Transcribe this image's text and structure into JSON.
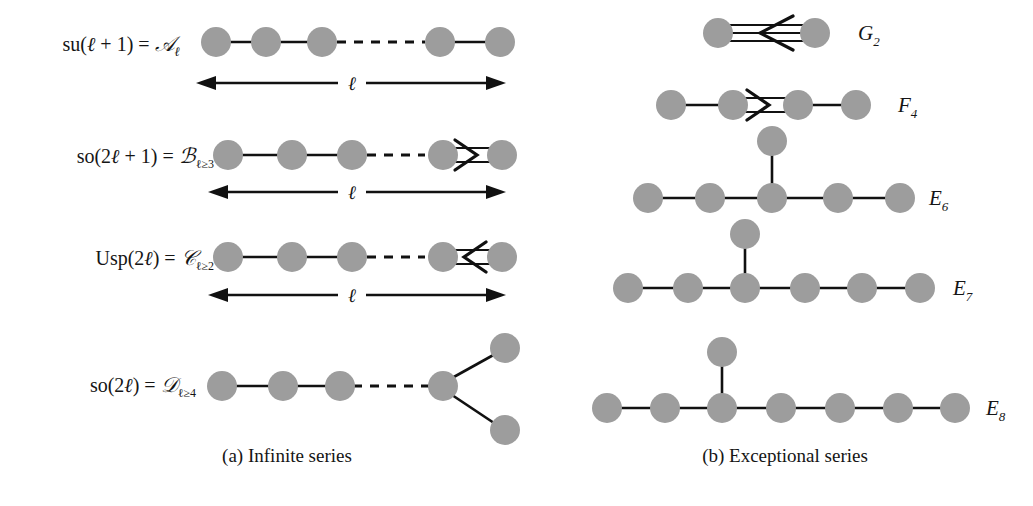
{
  "figure": {
    "background": "#ffffff",
    "node_color": "#9d9d9d",
    "line_color": "#111111",
    "panels": [
      {
        "id": "a",
        "caption": "(a) Infinite series"
      },
      {
        "id": "b",
        "caption": "(b) Exceptional series"
      }
    ]
  },
  "infinite_series": {
    "caption": "(a) Infinite series",
    "measure_symbol": "ℓ",
    "rows": [
      {
        "id": "A",
        "label_parts": {
          "lie": "su(",
          "arg": "ℓ + 1",
          "close": ") = ",
          "family": "𝒜",
          "subscript": "ℓ"
        },
        "label_plain": "su(ℓ + 1) = 𝒜ℓ",
        "nodes": 5,
        "dashed_gap": true,
        "bond": "single",
        "measure": "ℓ",
        "has_measure_arrow": true
      },
      {
        "id": "B",
        "label_parts": {
          "lie": "so(",
          "arg": "2ℓ + 1",
          "close": ") = ",
          "family": "ℬ",
          "subscript": "ℓ ≥ 3"
        },
        "label_plain": "so(2ℓ + 1) = ℬℓ≥3",
        "nodes": 5,
        "dashed_gap": true,
        "bond": "double-arrow-right",
        "measure": "ℓ",
        "has_measure_arrow": true
      },
      {
        "id": "C",
        "label_parts": {
          "lie": "Usp(",
          "arg": "2ℓ",
          "close": ") = ",
          "family": "𝒞",
          "subscript": "ℓ ≥ 2"
        },
        "label_plain": "Usp(2ℓ) = 𝒞ℓ≥2",
        "nodes": 5,
        "dashed_gap": true,
        "bond": "double-arrow-left",
        "measure": "ℓ",
        "has_measure_arrow": true
      },
      {
        "id": "D",
        "label_parts": {
          "lie": "so(",
          "arg": "2ℓ",
          "close": ") = ",
          "family": "𝒟",
          "subscript": "ℓ ≥ 4"
        },
        "label_plain": "so(2ℓ) = 𝒟ℓ≥4",
        "nodes": 4,
        "dashed_gap": true,
        "bond": "fork",
        "measure": "",
        "has_measure_arrow": false
      }
    ]
  },
  "exceptional_series": {
    "caption": "(b) Exceptional series",
    "rows": [
      {
        "id": "G2",
        "label_letter": "G",
        "label_sub": "2",
        "label_plain": "G₂",
        "chain_nodes": 2,
        "bond": "triple-arrow-left",
        "branch_at": null
      },
      {
        "id": "F4",
        "label_letter": "F",
        "label_sub": "4",
        "label_plain": "F₄",
        "chain_nodes": 4,
        "bond": "double-arrow-right",
        "bond_between": [
          2,
          3
        ],
        "branch_at": null
      },
      {
        "id": "E6",
        "label_letter": "E",
        "label_sub": "6",
        "label_plain": "E₆",
        "chain_nodes": 5,
        "bond": "single",
        "branch_at": 3
      },
      {
        "id": "E7",
        "label_letter": "E",
        "label_sub": "7",
        "label_plain": "E₇",
        "chain_nodes": 6,
        "bond": "single",
        "branch_at": 3
      },
      {
        "id": "E8",
        "label_letter": "E",
        "label_sub": "8",
        "label_plain": "E₈",
        "chain_nodes": 7,
        "bond": "single",
        "branch_at": 3
      }
    ]
  }
}
